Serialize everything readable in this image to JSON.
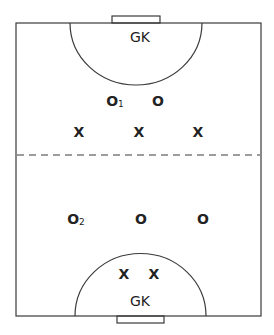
{
  "diagram": {
    "type": "netball-court",
    "top_circle_label": "GK",
    "bottom_circle_label": "GK",
    "players": {
      "top_half": {
        "o_marks": [
          {
            "label": "O",
            "subscript": "1"
          },
          {
            "label": "O",
            "subscript": ""
          }
        ],
        "x_marks": [
          {
            "label": "X"
          },
          {
            "label": "X"
          },
          {
            "label": "X"
          }
        ]
      },
      "bottom_half": {
        "o_marks": [
          {
            "label": "O",
            "subscript": "2"
          },
          {
            "label": "O",
            "subscript": ""
          },
          {
            "label": "O",
            "subscript": ""
          }
        ],
        "x_marks": [
          {
            "label": "X"
          },
          {
            "label": "X"
          }
        ]
      }
    },
    "line_color": "#3a3a3a",
    "text_color": "#222222"
  }
}
